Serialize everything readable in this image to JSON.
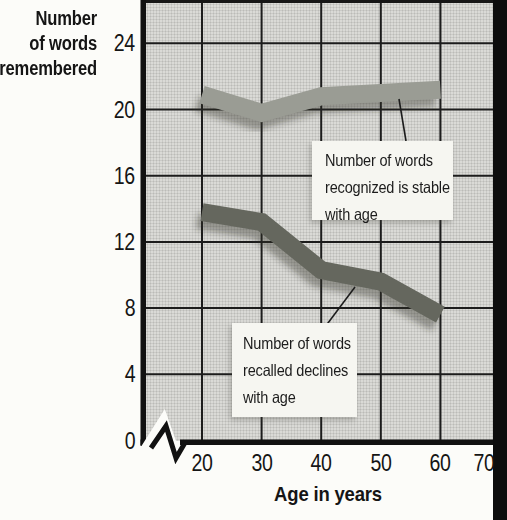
{
  "figure": {
    "y_axis_title_lines": [
      "Number",
      "of words",
      "remembered"
    ],
    "x_axis_title": "Age in years",
    "annotations": {
      "recognized": {
        "lines": [
          "Number of words",
          "recognized is stable",
          "with age"
        ]
      },
      "recalled": {
        "lines": [
          "Number of words",
          "recalled declines",
          "with age"
        ]
      }
    },
    "colors": {
      "recognized_band": "#9a9c94",
      "recalled_band": "#65675e",
      "plot_background": "#dadad6",
      "gridline": "#1c1c1c",
      "axis": "#111111",
      "scan_edge_bar": "#0d0d0d",
      "callout_background": "#f6f6f1"
    }
  },
  "chart_data": {
    "type": "line",
    "x": [
      20,
      30,
      40,
      50,
      60
    ],
    "series": [
      {
        "name": "Number of words recognized",
        "values": [
          20.9,
          19.8,
          20.8,
          21.0,
          21.2
        ],
        "color": "#9a9c94",
        "annotation": "Number of words recognized is stable with age"
      },
      {
        "name": "Number of words recalled",
        "values": [
          13.8,
          13.2,
          10.3,
          9.6,
          7.6
        ],
        "color": "#65675e",
        "annotation": "Number of words recalled declines with age"
      }
    ],
    "title": "",
    "xlabel": "Age in years",
    "ylabel": "Number of words remembered",
    "x_ticks": [
      20,
      30,
      40,
      50,
      60,
      70
    ],
    "y_ticks": [
      24,
      20,
      16,
      12,
      8,
      4,
      0
    ],
    "xlim": [
      20,
      70
    ],
    "ylim": [
      0,
      26
    ],
    "x_axis_break_near_origin": true,
    "grid": true,
    "legend_position": "none"
  }
}
